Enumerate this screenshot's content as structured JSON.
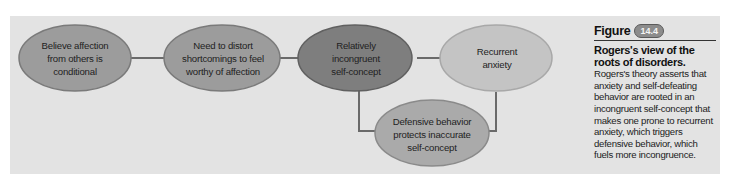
{
  "diagram": {
    "nodes": [
      {
        "id": "n1",
        "label": "Believe affection from others is conditional",
        "lines": [
          "Believe affection",
          "from others is",
          "conditional"
        ]
      },
      {
        "id": "n2",
        "label": "Need to distort shortcomings to feel worthy of affection",
        "lines": [
          "Need to distort",
          "shortcomings to feel",
          "worthy of affection"
        ]
      },
      {
        "id": "n3",
        "label": "Relatively incongruent self-concept",
        "lines": [
          "Relatively",
          "incongruent",
          "self-concept"
        ]
      },
      {
        "id": "n4",
        "label": "Recurrent anxiety",
        "lines": [
          "Recurrent",
          "anxiety"
        ]
      },
      {
        "id": "n5",
        "label": "Defensive behavior protects inaccurate self-concept",
        "lines": [
          "Defensive behavior",
          "protects inaccurate",
          "self-concept"
        ]
      }
    ],
    "edges": [
      {
        "from": "n1",
        "to": "n2"
      },
      {
        "from": "n2",
        "to": "n3"
      },
      {
        "from": "n3",
        "to": "n4"
      },
      {
        "from": "n4",
        "to": "n5"
      },
      {
        "from": "n5",
        "to": "n3"
      }
    ],
    "colors": {
      "panel": "#e3e3e3",
      "node_medium": "#9c9c9c",
      "node_dark": "#7e7e7e",
      "node_light": "#c4c4c4",
      "node_bottom": "#aaaaaa",
      "arrow": "#6a6a6a"
    }
  },
  "caption": {
    "figure_word": "Figure",
    "figure_number": "14.4",
    "title": "Rogers's view of the roots of disorders.",
    "body": "Rogers's theory asserts that anxiety and self-defeating behavior are rooted in an incongruent self-concept that makes one prone to recurrent anxiety, which triggers defensive behavior, which fuels more incongruence."
  }
}
